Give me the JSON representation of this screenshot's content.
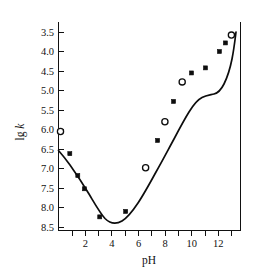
{
  "chart_data": {
    "type": "line",
    "title": "",
    "xlabel": "pH",
    "ylabel": "lg k",
    "ylabel_parts": {
      "lead": "lg ",
      "italic": "k"
    },
    "xlim": [
      0,
      13.6
    ],
    "ylim": [
      3.3,
      8.6
    ],
    "y_inverted": true,
    "grid": false,
    "legend": "none",
    "x_ticks_major": [
      2,
      4,
      6,
      8,
      10,
      12
    ],
    "x_ticks_minor": [
      1,
      3,
      5,
      7,
      9,
      11,
      13
    ],
    "x_tick_labels": [
      "2",
      "4",
      "6",
      "8",
      "10",
      "12"
    ],
    "y_ticks": [
      3.5,
      4.0,
      4.5,
      5.0,
      5.5,
      6.0,
      6.5,
      7.0,
      7.5,
      8.0,
      8.5
    ],
    "y_tick_labels": [
      "3.5",
      "4.0",
      "4.5",
      "5.0",
      "5.5",
      "6.0",
      "6.5",
      "7.0",
      "7.5",
      "8.0",
      "8.5"
    ],
    "series": [
      {
        "name": "lg k vs pH",
        "marker_open_label": "open circle",
        "marker_filled_label": "filled square",
        "points": [
          {
            "x": 0.15,
            "y": 6.05,
            "marker": "open"
          },
          {
            "x": 0.85,
            "y": 6.62,
            "marker": "filled"
          },
          {
            "x": 1.45,
            "y": 7.18,
            "marker": "filled"
          },
          {
            "x": 1.95,
            "y": 7.52,
            "marker": "filled"
          },
          {
            "x": 3.1,
            "y": 8.24,
            "marker": "filled"
          },
          {
            "x": 5.05,
            "y": 8.1,
            "marker": "filled"
          },
          {
            "x": 6.55,
            "y": 6.98,
            "marker": "open"
          },
          {
            "x": 7.45,
            "y": 6.28,
            "marker": "filled"
          },
          {
            "x": 8.0,
            "y": 5.8,
            "marker": "open"
          },
          {
            "x": 8.65,
            "y": 5.28,
            "marker": "filled"
          },
          {
            "x": 9.3,
            "y": 4.78,
            "marker": "open"
          },
          {
            "x": 10.0,
            "y": 4.55,
            "marker": "filled"
          },
          {
            "x": 11.05,
            "y": 4.42,
            "marker": "filled"
          },
          {
            "x": 12.1,
            "y": 4.0,
            "marker": "filled"
          },
          {
            "x": 12.55,
            "y": 3.78,
            "marker": "filled"
          },
          {
            "x": 13.0,
            "y": 3.58,
            "marker": "open"
          }
        ],
        "curve_path": "M 58.5,150.5 C 62,154.5 66,159.5 70,165 C 76,173.5 83,184 89,194 C 95,204 100,213 105,218.5 C 110,223.5 116,224.5 122,221 C 128,217.5 133,210.5 138,203 C 144,194 150,183 156,172 C 162,161.5 168,150 174,139 C 179,129.5 184,120 189,112 C 193,105.5 197,100 202,97.5 C 206,95.5 210,95 214,94 C 218,93 221,90 224,84 C 227,78 230,69 232,59 C 234,49 235,40 236,32",
        "minimum": {
          "x": 3.85,
          "y": 8.3
        },
        "plateau": {
          "x_range": [
            9.8,
            11.2
          ],
          "y": 4.5
        }
      }
    ]
  }
}
